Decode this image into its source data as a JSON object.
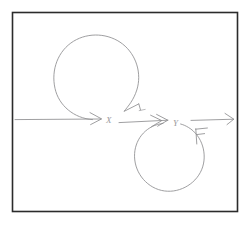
{
  "figure": {
    "background_color": "#ffffff",
    "frame_color": "#2b2b2b",
    "pencil_color": "#8e8e90",
    "faint_pencil_color": "#a9a9ac",
    "label_color": "#9a9a9d"
  },
  "frame": {
    "x": 12,
    "y": 12,
    "width": 226,
    "height": 200
  },
  "nodes": [
    {
      "id": "x",
      "label": "X",
      "x": 109,
      "y": 121
    },
    {
      "id": "y",
      "label": "Y",
      "x": 176,
      "y": 124
    }
  ],
  "arrows": [
    {
      "id": "incoming",
      "name": "incoming-arrow",
      "from_x": 15,
      "to_x": 101,
      "y": 119,
      "heads": 1
    },
    {
      "id": "x-to-y",
      "name": "x-to-y-arrow",
      "from_x": 119,
      "to_x": 168,
      "y": 121,
      "heads": 2
    },
    {
      "id": "outgoing",
      "name": "outgoing-arrow",
      "from_x": 191,
      "to_x": 234,
      "y": 120,
      "heads": 1
    }
  ],
  "loops": [
    {
      "id": "upper-loop",
      "name": "upper-self-loop",
      "center_x": 99,
      "center_y": 77,
      "radius": 43,
      "gap_side": "lower-right",
      "arrowhead": "tick"
    },
    {
      "id": "lower-loop",
      "name": "lower-self-loop",
      "center_x": 170,
      "center_y": 158,
      "radius": 35,
      "gap_side": "upper-right",
      "arrowhead": "double-tick"
    }
  ]
}
